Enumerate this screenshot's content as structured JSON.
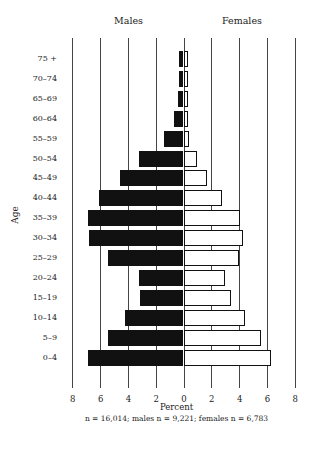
{
  "chart_data": {
    "type": "bar",
    "subtype": "population-pyramid",
    "title": "",
    "panel_labels": {
      "left": "Males",
      "right": "Females"
    },
    "xlabel": "Percent",
    "ylabel": "Age",
    "xlim": [
      -8,
      8
    ],
    "x_ticks": [
      "8",
      "6",
      "4",
      "2",
      "0",
      "2",
      "4",
      "6",
      "8"
    ],
    "grid": true,
    "legend": null,
    "caption": "n = 16,014; males n = 9,221; females n = 6,783",
    "categories": [
      "75 +",
      "70–74",
      "65–69",
      "60–64",
      "55–59",
      "50–54",
      "45–49",
      "40–44",
      "35–39",
      "30–34",
      "25–29",
      "20–24",
      "15–19",
      "10–14",
      "5–9",
      "0–4"
    ],
    "series": [
      {
        "name": "Males",
        "color": "#111111",
        "values": [
          0.3,
          0.3,
          0.4,
          0.7,
          1.4,
          3.2,
          4.6,
          6.1,
          6.9,
          6.8,
          5.4,
          3.2,
          3.1,
          4.2,
          5.4,
          6.9
        ]
      },
      {
        "name": "Females",
        "color": "#ffffff",
        "values": [
          0.3,
          0.3,
          0.3,
          0.3,
          0.4,
          1.0,
          1.7,
          2.8,
          4.1,
          4.3,
          4.0,
          3.0,
          3.4,
          4.4,
          5.6,
          6.3
        ]
      }
    ]
  },
  "labels": {
    "males": "Males",
    "females": "Females",
    "age": "Age",
    "percent": "Percent",
    "caption": "n = 16,014; males n = 9,221; females n = 6,783"
  }
}
